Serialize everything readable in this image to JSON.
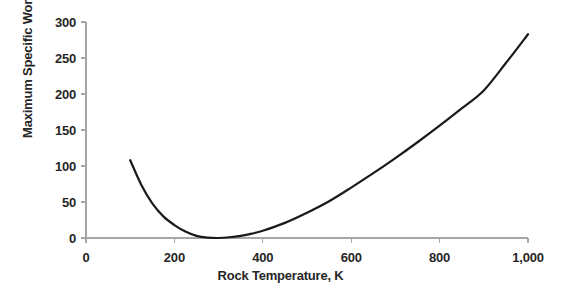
{
  "chart_data": {
    "type": "line",
    "title": "",
    "xlabel": "Rock Temperature, K",
    "ylabel": "Maximum Specific Work, kJ/kg",
    "xlim": [
      0,
      1000
    ],
    "ylim": [
      0,
      300
    ],
    "xticks": [
      0,
      200,
      400,
      600,
      800,
      1000
    ],
    "xtick_labels": [
      "0",
      "200",
      "400",
      "600",
      "800",
      "1,000"
    ],
    "yticks": [
      0,
      50,
      100,
      150,
      200,
      250,
      300
    ],
    "ytick_labels": [
      "0",
      "50",
      "100",
      "150",
      "200",
      "250",
      "300"
    ],
    "grid": false,
    "legend": false,
    "series": [
      {
        "name": "Maximum Specific Work",
        "color": "#1a1a1a",
        "line_width": 2.2,
        "x": [
          100,
          125,
          150,
          175,
          200,
          225,
          250,
          275,
          300,
          325,
          350,
          375,
          400,
          450,
          500,
          550,
          600,
          650,
          700,
          750,
          800,
          850,
          900,
          950,
          1000
        ],
        "y": [
          108,
          74,
          48,
          30,
          18,
          9,
          3,
          0.5,
          0,
          1,
          3,
          6,
          10,
          21,
          35,
          51,
          70,
          90,
          111,
          133,
          156,
          180,
          205,
          243,
          283
        ]
      }
    ],
    "annotations": [],
    "axis_color": "#a6a6a6",
    "text_color": "#262626",
    "background": "#ffffff"
  },
  "geometry": {
    "plot_left": 86,
    "plot_right": 528,
    "plot_top": 22,
    "plot_bottom": 238
  }
}
